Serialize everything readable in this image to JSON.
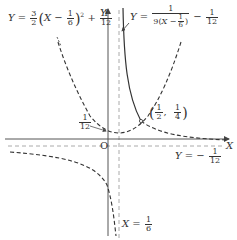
{
  "axes": {
    "x_label": "X",
    "y_label": "Y",
    "origin_label": "O"
  },
  "labels": {
    "parabola": {
      "lhs": "Y =",
      "coef_num": "3",
      "coef_den": "2",
      "var": "X −",
      "shift_num": "1",
      "shift_den": "6",
      "exp": "2",
      "plus": "+",
      "const_num": "1",
      "const_den": "12"
    },
    "hyperbola": {
      "lhs": "Y =",
      "num": "1",
      "den_coef": "9",
      "den_var": "X −",
      "den_shift_num": "1",
      "den_shift_den": "6",
      "minus": "−",
      "const_num": "1",
      "const_den": "12"
    },
    "vertex_y": {
      "num": "1",
      "den": "12"
    },
    "intersection": {
      "x_num": "1",
      "x_den": "2",
      "comma": ",",
      "y_num": "1",
      "y_den": "4"
    },
    "horizontal_asymptote": {
      "lhs": "Y = −",
      "num": "1",
      "den": "12"
    },
    "vertical_asymptote": {
      "lhs": "X =",
      "num": "1",
      "den": "6"
    }
  },
  "colors": {
    "axis": "#555555",
    "curve": "#333333",
    "asymptote": "#aaaaaa"
  }
}
